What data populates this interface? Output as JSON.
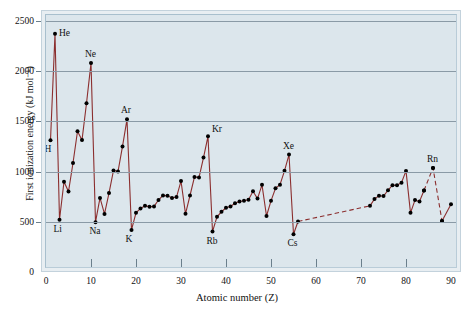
{
  "chart_data": {
    "type": "line",
    "title": "",
    "xlabel": "Atomic number (Z)",
    "ylabel": "First ionization energy (kJ mol⁻¹)",
    "xlim": [
      0,
      90
    ],
    "ylim": [
      0,
      2500
    ],
    "grid": true,
    "legend": "none",
    "xticks": [
      "0",
      "10",
      "20",
      "30",
      "40",
      "50",
      "60",
      "70",
      "80",
      "90"
    ],
    "xtick_values": [
      0,
      10,
      20,
      30,
      40,
      50,
      60,
      70,
      80,
      90
    ],
    "yticks": [
      "0",
      "500",
      "1000",
      "1500",
      "2000",
      "2500"
    ],
    "ytick_values": [
      0,
      500,
      1000,
      1500,
      2000,
      2500
    ],
    "line_color": "#8b2e2e",
    "marker_color": "#000000",
    "plot_background": "#dce6ec",
    "grid_color": "#8a9aa6",
    "series": [
      {
        "name": "First ionization energy",
        "x": [
          1,
          2,
          3,
          4,
          5,
          6,
          7,
          8,
          9,
          10,
          11,
          12,
          13,
          14,
          15,
          16,
          17,
          18,
          19,
          20,
          21,
          22,
          23,
          24,
          25,
          26,
          27,
          28,
          29,
          30,
          31,
          32,
          33,
          34,
          35,
          36,
          37,
          38,
          39,
          40,
          41,
          42,
          43,
          44,
          45,
          46,
          47,
          48,
          49,
          50,
          51,
          52,
          53,
          54,
          55,
          56
        ],
        "values": [
          1312,
          2372,
          520,
          899,
          801,
          1086,
          1402,
          1314,
          1681,
          2081,
          496,
          738,
          578,
          786,
          1012,
          1000,
          1251,
          1521,
          419,
          590,
          633,
          659,
          651,
          653,
          717,
          763,
          760,
          737,
          746,
          906,
          579,
          762,
          947,
          941,
          1140,
          1351,
          403,
          550,
          600,
          640,
          652,
          684,
          702,
          710,
          720,
          804,
          731,
          868,
          558,
          709,
          834,
          869,
          1008,
          1170,
          376,
          503
        ]
      },
      {
        "name": "Interpolated gap (La-Hf)",
        "style": "dashed",
        "x": [
          56,
          72
        ],
        "values": [
          503,
          659
        ]
      },
      {
        "name": "Sixth period continuation",
        "x": [
          72,
          73,
          74,
          75,
          76,
          77,
          78,
          79,
          80,
          81,
          82,
          83,
          84
        ],
        "values": [
          659,
          728,
          759,
          756,
          814,
          865,
          864,
          890,
          1007,
          589,
          716,
          703,
          812
        ]
      },
      {
        "name": "Rn dashed segment",
        "style": "dashed",
        "x": [
          84,
          86,
          88
        ],
        "values": [
          812,
          1037,
          509
        ]
      },
      {
        "name": "Ra to end",
        "x": [
          88,
          90
        ],
        "values": [
          509,
          675
        ]
      }
    ],
    "point_labels": [
      {
        "text": "H",
        "x": 1,
        "y": 1312,
        "pos": "below"
      },
      {
        "text": "He",
        "x": 2,
        "y": 2372,
        "pos": "right"
      },
      {
        "text": "Li",
        "x": 3,
        "y": 520,
        "pos": "below"
      },
      {
        "text": "Ne",
        "x": 10,
        "y": 2081,
        "pos": "above"
      },
      {
        "text": "Na",
        "x": 11,
        "y": 496,
        "pos": "below"
      },
      {
        "text": "Ar",
        "x": 18,
        "y": 1521,
        "pos": "above"
      },
      {
        "text": "K",
        "x": 19,
        "y": 419,
        "pos": "below"
      },
      {
        "text": "Kr",
        "x": 36,
        "y": 1351,
        "pos": "above-right"
      },
      {
        "text": "Rb",
        "x": 37,
        "y": 403,
        "pos": "below"
      },
      {
        "text": "Xe",
        "x": 54,
        "y": 1170,
        "pos": "above"
      },
      {
        "text": "Cs",
        "x": 55,
        "y": 376,
        "pos": "below"
      },
      {
        "text": "Rn",
        "x": 86,
        "y": 1037,
        "pos": "above"
      }
    ]
  }
}
